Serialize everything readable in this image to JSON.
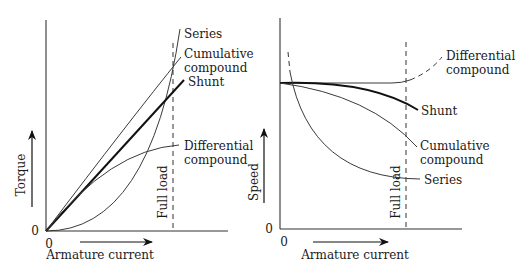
{
  "left_chart": {
    "title": "Torque vs armature current",
    "y_label": "Torque",
    "x_label": "Armature current",
    "y_origin": "0",
    "x_origin": "0",
    "marker_label": "Full load",
    "curves": {
      "series": "Series",
      "cumulative_line1": "Cumulative",
      "cumulative_line2": "compound",
      "shunt": "Shunt",
      "differential_line1": "Differential",
      "differential_line2": "compound"
    }
  },
  "right_chart": {
    "title": "Speed vs armature current",
    "y_label": "Speed",
    "x_label": "Armature current",
    "y_origin": "0",
    "x_origin": "0",
    "marker_label": "Full load",
    "curves": {
      "differential_line1": "Differential",
      "differential_line2": "compound",
      "shunt": "Shunt",
      "cumulative_line1": "Cumulative",
      "cumulative_line2": "compound",
      "series": "Series"
    }
  },
  "colors": {
    "line": "#333333",
    "background": "#ffffff"
  }
}
